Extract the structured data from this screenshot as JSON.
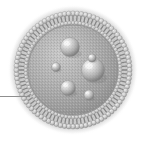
{
  "figure": {
    "type": "scientific-illustration",
    "canvas": {
      "width": 144,
      "height": 143,
      "background": "#ffffff"
    },
    "style": {
      "palette": "grayscale",
      "rendering": "halftone-shaded"
    }
  },
  "colors": {
    "background": "#ffffff",
    "membrane_outer_ring": "#9a9a9a",
    "membrane_head_bead": "#d8d8d8",
    "membrane_tail": "#7f7f7f",
    "lumen_fill": "#a9a9a9",
    "lumen_highlight": "#c6c6c6",
    "lumen_shadow": "#8c8c8c",
    "particle_light": "#e8e8e8",
    "particle_mid": "#b4b4b4",
    "particle_dark": "#808080",
    "leader_line": "#8f8f8f",
    "outer_halo": "#bdbdbd"
  },
  "vesicle": {
    "label": "liposome",
    "center": {
      "x": 73,
      "y": 70
    },
    "outer_radius": 66,
    "membrane_outer_radius": 58,
    "membrane_inner_radius": 46,
    "lumen_radius": 45,
    "lipid_count": 84,
    "head_bead_radius": 2.5,
    "tail_width": 1.3
  },
  "inner_particles": [
    {
      "name": "particle-top",
      "cx": 70,
      "cy": 47,
      "r": 9.5,
      "highlight_offset": {
        "x": -3,
        "y": -3.5
      }
    },
    {
      "name": "particle-large-right",
      "cx": 93,
      "cy": 70,
      "r": 11.5,
      "highlight_offset": {
        "x": -4,
        "y": -4
      }
    },
    {
      "name": "particle-small-left",
      "cx": 56,
      "cy": 67,
      "r": 4.5,
      "highlight_offset": {
        "x": -1.5,
        "y": -1.5
      }
    },
    {
      "name": "particle-lower-left",
      "cx": 68,
      "cy": 88,
      "r": 7.5,
      "highlight_offset": {
        "x": -2.5,
        "y": -3
      }
    },
    {
      "name": "particle-lower-right",
      "cx": 89,
      "cy": 95,
      "r": 5.0,
      "highlight_offset": {
        "x": -1.8,
        "y": -2
      }
    },
    {
      "name": "particle-upper-stub",
      "cx": 92,
      "cy": 58,
      "r": 4.0,
      "highlight_offset": {
        "x": -1.4,
        "y": -1.6
      }
    }
  ],
  "leader_line": {
    "name": "callout-leader-line",
    "x1": 0,
    "y1": 96,
    "x2": 30,
    "y2": 96,
    "stroke_width": 1,
    "color": "#8f8f8f"
  },
  "annotations": {
    "alt_text": "Grayscale cross-sectional illustration of a liposome: a spherical phospholipid bilayer shell made of radially arranged lipid molecules with round head groups, enclosing a shaded interior containing six smaller spheres. A thin horizontal leader line enters from the left edge toward the membrane."
  }
}
